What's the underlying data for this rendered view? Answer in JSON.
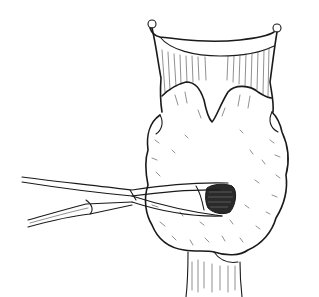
{
  "illustration": {
    "subject": "thyroid gland with larynx and trachea, forceps dissecting lower lobe",
    "style": "black-and-white pen line drawing",
    "colors": {
      "background": "#ffffff",
      "ink": "#1a1a1a"
    },
    "elements": [
      "thyroid-cartilage",
      "thyroid-gland-lobes",
      "isthmus",
      "trachea",
      "forceps",
      "dissected-nodule"
    ]
  }
}
